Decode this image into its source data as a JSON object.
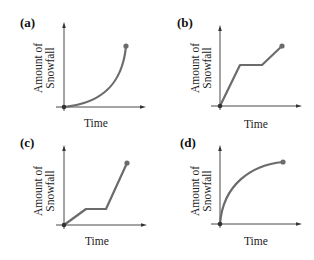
{
  "figure": {
    "panels": [
      {
        "id": "a",
        "label": "(a)",
        "ylabel_line1": "Amount of",
        "ylabel_line2": "Snowfall",
        "xlabel": "Time",
        "curve_type": "convex-increasing"
      },
      {
        "id": "b",
        "label": "(b)",
        "ylabel_line1": "Amount of",
        "ylabel_line2": "Snowfall",
        "xlabel": "Time",
        "curve_type": "rise-plateau-rise"
      },
      {
        "id": "c",
        "label": "(c)",
        "ylabel_line1": "Amount of",
        "ylabel_line2": "Snowfall",
        "xlabel": "Time",
        "curve_type": "slow-rise-plateau-steep-rise"
      },
      {
        "id": "d",
        "label": "(d)",
        "ylabel_line1": "Amount of",
        "ylabel_line2": "Snowfall",
        "xlabel": "Time",
        "curve_type": "concave-increasing"
      }
    ]
  },
  "colors": {
    "axis": "#333333",
    "curve": "#6b6b6b",
    "text": "#222222"
  }
}
